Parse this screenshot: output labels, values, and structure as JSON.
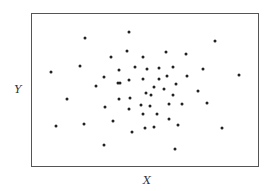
{
  "chart_data": {
    "type": "scatter",
    "title": "",
    "xlabel": "X",
    "ylabel": "Y",
    "grid": false,
    "legend": null,
    "axis_ticks": false,
    "plot_frame_px": {
      "left": 31,
      "top": 13,
      "right": 259,
      "bottom": 167
    },
    "coordinate_system": "Normalized: x from 0 (left edge of frame) to 1 (right edge); y from 0 (bottom edge) to 1 (top edge). No numeric scale is shown on the axes.",
    "points": [
      {
        "x": 0.232,
        "y": 0.846
      },
      {
        "x": 0.425,
        "y": 0.885
      },
      {
        "x": 0.346,
        "y": 0.721
      },
      {
        "x": 0.417,
        "y": 0.76
      },
      {
        "x": 0.487,
        "y": 0.721
      },
      {
        "x": 0.083,
        "y": 0.623
      },
      {
        "x": 0.211,
        "y": 0.662
      },
      {
        "x": 0.382,
        "y": 0.636
      },
      {
        "x": 0.452,
        "y": 0.656
      },
      {
        "x": 0.316,
        "y": 0.591
      },
      {
        "x": 0.281,
        "y": 0.532
      },
      {
        "x": 0.377,
        "y": 0.552
      },
      {
        "x": 0.386,
        "y": 0.552
      },
      {
        "x": 0.425,
        "y": 0.571
      },
      {
        "x": 0.487,
        "y": 0.578
      },
      {
        "x": 0.588,
        "y": 0.753
      },
      {
        "x": 0.675,
        "y": 0.74
      },
      {
        "x": 0.803,
        "y": 0.825
      },
      {
        "x": 0.504,
        "y": 0.643
      },
      {
        "x": 0.557,
        "y": 0.649
      },
      {
        "x": 0.618,
        "y": 0.656
      },
      {
        "x": 0.75,
        "y": 0.643
      },
      {
        "x": 0.908,
        "y": 0.604
      },
      {
        "x": 0.557,
        "y": 0.578
      },
      {
        "x": 0.592,
        "y": 0.597
      },
      {
        "x": 0.68,
        "y": 0.597
      },
      {
        "x": 0.632,
        "y": 0.545
      },
      {
        "x": 0.535,
        "y": 0.526
      },
      {
        "x": 0.579,
        "y": 0.513
      },
      {
        "x": 0.154,
        "y": 0.448
      },
      {
        "x": 0.32,
        "y": 0.396
      },
      {
        "x": 0.382,
        "y": 0.448
      },
      {
        "x": 0.43,
        "y": 0.455
      },
      {
        "x": 0.5,
        "y": 0.487
      },
      {
        "x": 0.425,
        "y": 0.383
      },
      {
        "x": 0.478,
        "y": 0.409
      },
      {
        "x": 0.487,
        "y": 0.351
      },
      {
        "x": 0.105,
        "y": 0.273
      },
      {
        "x": 0.228,
        "y": 0.286
      },
      {
        "x": 0.355,
        "y": 0.305
      },
      {
        "x": 0.439,
        "y": 0.234
      },
      {
        "x": 0.316,
        "y": 0.149
      },
      {
        "x": 0.496,
        "y": 0.26
      },
      {
        "x": 0.522,
        "y": 0.474
      },
      {
        "x": 0.618,
        "y": 0.474
      },
      {
        "x": 0.728,
        "y": 0.5
      },
      {
        "x": 0.518,
        "y": 0.403
      },
      {
        "x": 0.601,
        "y": 0.416
      },
      {
        "x": 0.658,
        "y": 0.416
      },
      {
        "x": 0.768,
        "y": 0.422
      },
      {
        "x": 0.548,
        "y": 0.351
      },
      {
        "x": 0.601,
        "y": 0.318
      },
      {
        "x": 0.64,
        "y": 0.279
      },
      {
        "x": 0.833,
        "y": 0.26
      },
      {
        "x": 0.535,
        "y": 0.266
      },
      {
        "x": 0.627,
        "y": 0.123
      }
    ],
    "point_color": "#222222",
    "frame_color": "#555555"
  }
}
